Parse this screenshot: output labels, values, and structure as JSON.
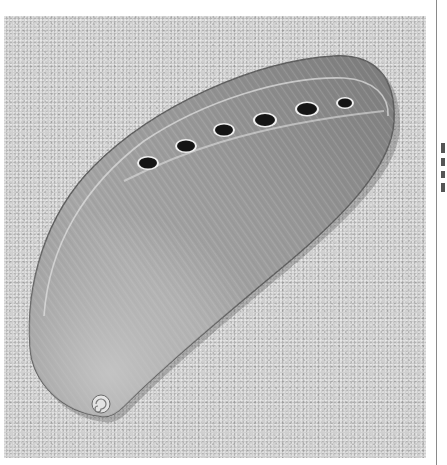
{
  "photo": {
    "subject": "abalone shell on sand",
    "color_mode": "grayscale",
    "colors": {
      "sand": "#cfcfcf",
      "shell_base": "#9a9a9a",
      "shell_highlight": "#dcdcdc",
      "shell_shadow": "#6e6e6e",
      "hole": "#151515",
      "page_background": "#ffffff",
      "rule": "#8a8a8a"
    },
    "respiratory_holes": [
      {
        "cx": 144,
        "cy": 147
      },
      {
        "cx": 182,
        "cy": 130
      },
      {
        "cx": 220,
        "cy": 114
      },
      {
        "cx": 261,
        "cy": 104
      },
      {
        "cx": 303,
        "cy": 93
      },
      {
        "cx": 341,
        "cy": 87
      }
    ]
  },
  "margin_strip": {
    "fragment_marks": [
      {
        "top": 143,
        "height": 10
      },
      {
        "top": 158,
        "height": 8
      },
      {
        "top": 171,
        "height": 7
      },
      {
        "top": 183,
        "height": 9
      }
    ]
  }
}
